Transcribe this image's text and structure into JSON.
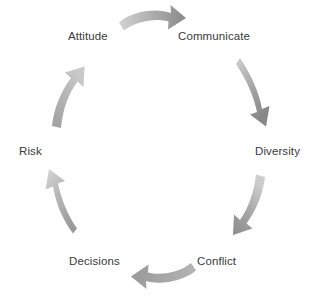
{
  "diagram": {
    "type": "cycle",
    "direction": "clockwise",
    "background_color": "#ffffff",
    "text_color": "#3a3a3a",
    "arrow_color_light": "#c9c9c9",
    "arrow_color_dark": "#8e8e8e",
    "nodes": [
      {
        "id": "attitude",
        "label": "Attitude"
      },
      {
        "id": "communicate",
        "label": "Communicate"
      },
      {
        "id": "diversity",
        "label": "Diversity"
      },
      {
        "id": "conflict",
        "label": "Conflict"
      },
      {
        "id": "decisions",
        "label": "Decisions"
      },
      {
        "id": "risk",
        "label": "Risk"
      }
    ],
    "arrows": [
      {
        "id": "attitude-to-communicate",
        "from": "Attitude",
        "to": "Communicate"
      },
      {
        "id": "communicate-to-diversity",
        "from": "Communicate",
        "to": "Diversity"
      },
      {
        "id": "diversity-to-conflict",
        "from": "Diversity",
        "to": "Conflict"
      },
      {
        "id": "conflict-to-decisions",
        "from": "Conflict",
        "to": "Decisions"
      },
      {
        "id": "decisions-to-risk",
        "from": "Decisions",
        "to": "Risk"
      },
      {
        "id": "risk-to-attitude",
        "from": "Risk",
        "to": "Attitude"
      }
    ]
  }
}
